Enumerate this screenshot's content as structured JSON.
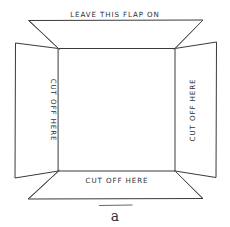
{
  "figure": {
    "caption": "a",
    "labels": {
      "top_flap": "LEAVE THIS FLAP ON",
      "left_flap": "CUT OFF HERE",
      "right_flap": "CUT OFF HERE",
      "bottom_flap": "CUT OFF HERE"
    },
    "colors": {
      "ink": "#3a3a3a",
      "background": "#ffffff"
    }
  }
}
